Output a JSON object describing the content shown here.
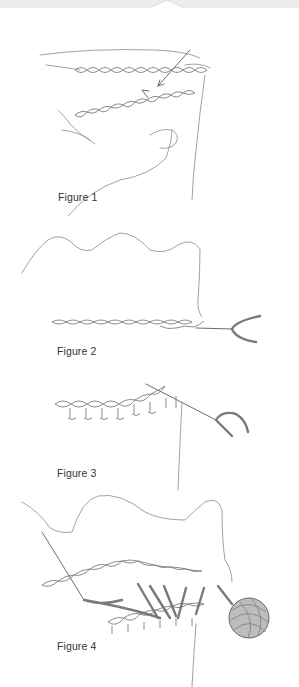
{
  "document": {
    "type": "instructional illustration sheet",
    "figures": [
      {
        "id": "figure-1",
        "caption": "Figure 1",
        "depicts": "hand holding foundation chain, hook inserted with direction arrows"
      },
      {
        "id": "figure-2",
        "caption": "Figure 2",
        "depicts": "foundation chain with fabric edge above, hook working stitches at right"
      },
      {
        "id": "figure-3",
        "caption": "Figure 3",
        "depicts": "row of stitches worked along chain with hook at right"
      },
      {
        "id": "figure-4",
        "caption": "Figure 4",
        "depicts": "needle joining chain to fabric edge with yarn ball at right"
      }
    ]
  },
  "colors": {
    "background": "#ffffff",
    "line": "#8a8a8a",
    "caption_text": "#333333",
    "top_strip": "#ececec"
  }
}
